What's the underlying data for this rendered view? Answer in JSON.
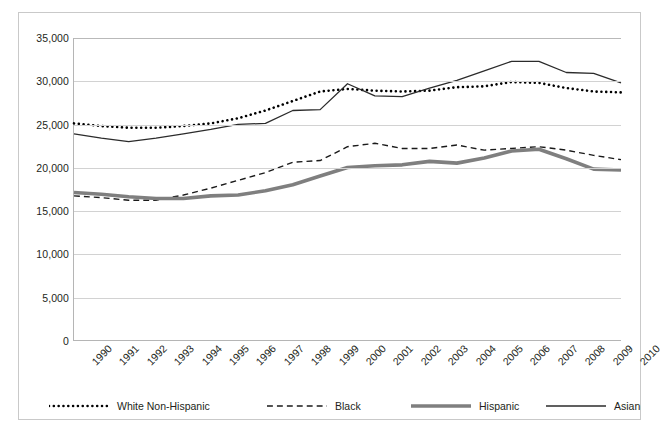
{
  "chart_data": {
    "type": "line",
    "title": "",
    "subtitle": "",
    "xlabel": "",
    "ylabel": "",
    "grid": true,
    "legend_position": "bottom",
    "xlim": [
      1990,
      2010
    ],
    "ylim": [
      0,
      35000
    ],
    "ytick_labels": [
      "35,000",
      "30,000",
      "25,000",
      "20,000",
      "15,000",
      "10,000",
      "5,000",
      "0"
    ],
    "ytick_values": [
      35000,
      30000,
      25000,
      20000,
      15000,
      10000,
      5000,
      0
    ],
    "categories": [
      "1990",
      "1991",
      "1992",
      "1993",
      "1994",
      "1995",
      "1996",
      "1997",
      "1998",
      "1999",
      "2000",
      "2001",
      "2002",
      "2003",
      "2004",
      "2005",
      "2006",
      "2007",
      "2008",
      "2009",
      "2010"
    ],
    "x": [
      1990,
      1991,
      1992,
      1993,
      1994,
      1995,
      1996,
      1997,
      1998,
      1999,
      2000,
      2001,
      2002,
      2003,
      2004,
      2005,
      2006,
      2007,
      2008,
      2009,
      2010
    ],
    "series": [
      {
        "name": "White Non-Hispanic",
        "style": "dotted",
        "color": "#000000",
        "width": 2.6,
        "values": [
          25100,
          24800,
          24600,
          24600,
          24800,
          25100,
          25700,
          26600,
          27700,
          28800,
          29100,
          28900,
          28800,
          28900,
          29300,
          29400,
          29900,
          29800,
          29200,
          28800,
          28700
        ]
      },
      {
        "name": "Black",
        "style": "dashed",
        "color": "#1a1a1a",
        "width": 1.4,
        "values": [
          16700,
          16500,
          16200,
          16200,
          16800,
          17600,
          18500,
          19400,
          20600,
          20800,
          22400,
          22800,
          22200,
          22200,
          22600,
          22000,
          22200,
          22400,
          22000,
          21400,
          20900
        ]
      },
      {
        "name": "Hispanic",
        "style": "solid-thick",
        "color": "#7f7f7f",
        "width": 3.6,
        "values": [
          17100,
          16900,
          16600,
          16400,
          16400,
          16700,
          16800,
          17300,
          18000,
          19000,
          20000,
          20200,
          20300,
          20700,
          20500,
          21100,
          21900,
          22100,
          21000,
          19800,
          19700
        ]
      },
      {
        "name": "Asian",
        "style": "solid-thin",
        "color": "#2b2b2b",
        "width": 1.3,
        "values": [
          23900,
          23400,
          23000,
          23400,
          23900,
          24400,
          25000,
          25100,
          26600,
          26700,
          29700,
          28300,
          28200,
          29200,
          30100,
          31200,
          32300,
          32300,
          31000,
          30900,
          29800
        ]
      }
    ]
  },
  "legend": {
    "entries": [
      {
        "label": "White Non-Hispanic",
        "style": "dotted"
      },
      {
        "label": "Black",
        "style": "dashed"
      },
      {
        "label": "Hispanic",
        "style": "solid-thick"
      },
      {
        "label": "Asian",
        "style": "solid-thin"
      }
    ]
  }
}
